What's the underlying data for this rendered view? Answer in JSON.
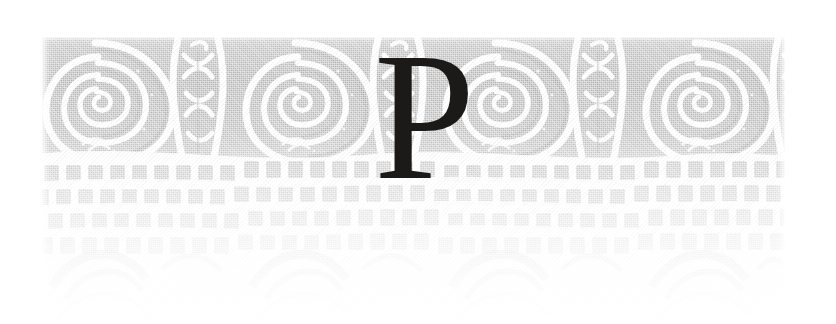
{
  "page": {
    "kind": "decorated-chapter-opening",
    "width": 836,
    "height": 324,
    "paper_color": "#ffffff"
  },
  "dropcap": {
    "letter": "P",
    "color": "#1c1a19",
    "style": "serif",
    "name": "drop-cap-letter-p"
  },
  "ornament": {
    "label": "ornamental headpiece",
    "motif": "running spiral volute band over fading brick lattice",
    "bounds": {
      "x": 42,
      "y": 37,
      "width": 743,
      "height": 287
    },
    "colors": {
      "ground": "#b9b9b9",
      "ground_light": "#c9c9c9",
      "ground_dark": "#a9a9a9",
      "line": "#ffffff",
      "brick": "#c4c4c4",
      "arc": "#d8d8d8"
    },
    "bands": [
      {
        "name": "spiral-band",
        "y": 0,
        "height": 120,
        "motif": "volute spirals"
      },
      {
        "name": "lattice-band",
        "y": 120,
        "height": 100,
        "motif": "brick rows"
      },
      {
        "name": "arc-band",
        "y": 220,
        "height": 67,
        "motif": "faint domes"
      }
    ],
    "spiral_period": 200,
    "spiral_centers": [
      53,
      253,
      453,
      653
    ],
    "filler_centers": [
      153,
      353,
      553,
      753
    ]
  }
}
